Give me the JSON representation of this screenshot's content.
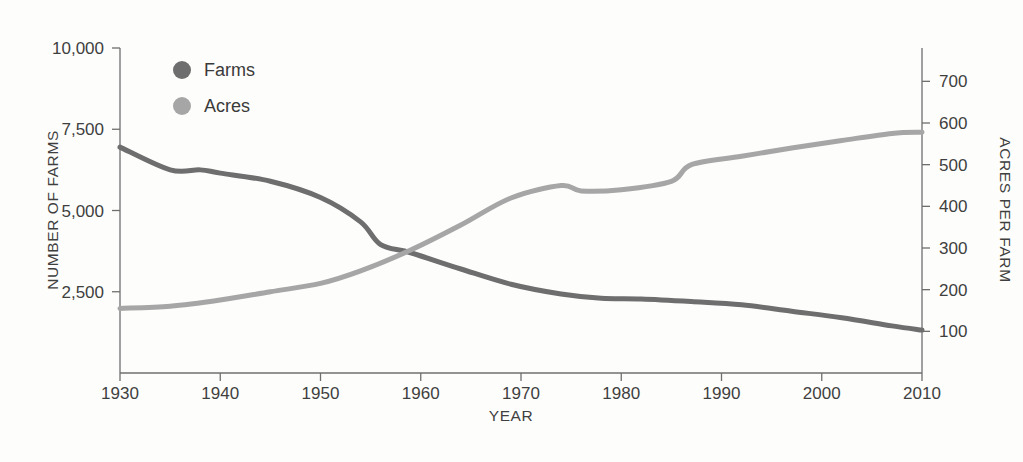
{
  "chart_data": {
    "type": "line",
    "title": "",
    "xlabel": "YEAR",
    "ylabel": "NUMBER OF FARMS",
    "y2label": "ACRES PER FARM",
    "xlim": [
      1930,
      2010
    ],
    "ylim": [
      0,
      10000
    ],
    "y2lim": [
      0,
      780
    ],
    "grid": false,
    "legend_position": "top-left",
    "xticks": [
      1930,
      1940,
      1950,
      1960,
      1970,
      1980,
      1990,
      2000,
      2010
    ],
    "xtick_labels": [
      "1930",
      "1940",
      "1950",
      "1960",
      "1970",
      "1980",
      "1990",
      "2000",
      "2010"
    ],
    "yticks": [
      2500,
      5000,
      7500,
      10000
    ],
    "ytick_labels": [
      "2,500",
      "5,000",
      "7,500",
      "10,000"
    ],
    "y2ticks": [
      100,
      200,
      300,
      400,
      500,
      600,
      700
    ],
    "y2tick_labels": [
      "100",
      "200",
      "300",
      "400",
      "500",
      "600",
      "700"
    ],
    "series": [
      {
        "name": "Farms",
        "axis": "left",
        "color": "#6e6e6e",
        "x": [
          1930,
          1935,
          1938,
          1940,
          1945,
          1950,
          1954,
          1956,
          1959,
          1964,
          1969,
          1974,
          1978,
          1982,
          1987,
          1992,
          1997,
          2002,
          2007,
          2010
        ],
        "values": [
          6950,
          6250,
          6250,
          6150,
          5900,
          5400,
          4650,
          3950,
          3700,
          3200,
          2730,
          2430,
          2300,
          2280,
          2200,
          2100,
          1900,
          1700,
          1450,
          1320
        ]
      },
      {
        "name": "Acres",
        "axis": "right",
        "color": "#a6a6a6",
        "x": [
          1930,
          1935,
          1940,
          1945,
          1950,
          1954,
          1959,
          1964,
          1969,
          1974,
          1976,
          1980,
          1985,
          1987,
          1992,
          1997,
          2002,
          2007,
          2010
        ],
        "values": [
          155,
          160,
          175,
          195,
          215,
          245,
          295,
          355,
          420,
          450,
          437,
          440,
          460,
          500,
          520,
          540,
          558,
          575,
          578
        ]
      }
    ]
  },
  "legend": {
    "items": [
      {
        "label": "Farms",
        "color": "#6e6e6e",
        "marker": "circle"
      },
      {
        "label": "Acres",
        "color": "#a6a6a6",
        "marker": "circle"
      }
    ]
  },
  "axes": {
    "x_title": "YEAR",
    "y_left_title": "NUMBER OF FARMS",
    "y_right_title": "ACRES PER FARM"
  }
}
